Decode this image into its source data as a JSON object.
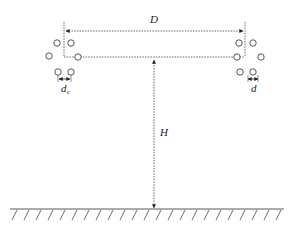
{
  "diagram": {
    "labels": {
      "width": "D",
      "height": "H",
      "left_spacing": "d",
      "left_spacing_sub": "c",
      "right_spacing": "d"
    },
    "colors": {
      "stroke": "#333333",
      "background": "#ffffff"
    },
    "left_conductor_bundle": {
      "count": 6,
      "circles": [
        [
          57,
          43
        ],
        [
          71,
          43
        ],
        [
          50,
          56
        ],
        [
          77,
          56
        ],
        [
          58,
          72
        ],
        [
          71,
          72
        ]
      ]
    },
    "right_conductor_bundle": {
      "count": 6,
      "circles": [
        [
          239,
          43
        ],
        [
          253,
          43
        ],
        [
          233,
          56
        ],
        [
          261,
          56
        ],
        [
          239,
          72
        ],
        [
          253,
          72
        ]
      ]
    }
  }
}
